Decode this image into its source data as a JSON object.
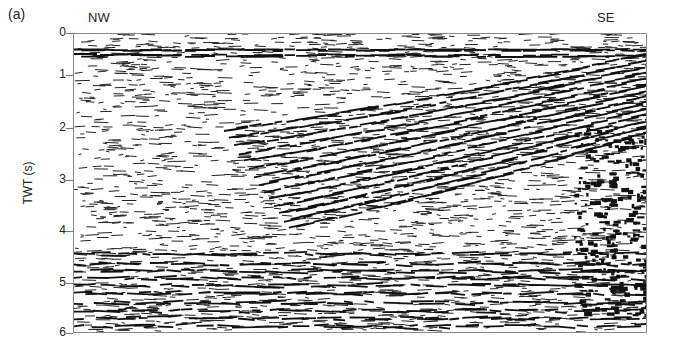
{
  "chart_data": {
    "type": "seismic-section",
    "panel_label": "(a)",
    "title": "",
    "xlabel": "",
    "ylabel": "TWT (s)",
    "direction_labels": {
      "left": "NW",
      "right": "SE"
    },
    "y_ticks": [
      0,
      1,
      2,
      3,
      4,
      5,
      6
    ],
    "ylim": [
      0,
      6
    ],
    "y_inverted": true,
    "grid": false,
    "legend": null,
    "features": [
      {
        "name": "strong flat reflector",
        "twt_s": 0.3,
        "extent": "full width"
      },
      {
        "name": "dipping reflector package",
        "description": "reflectors rising from ~3.3 s at centre-left to ~0.5 s at SE edge"
      },
      {
        "name": "chaotic high-amplitude zone",
        "location": "SE edge",
        "twt_range_s": [
          2,
          5.5
        ]
      }
    ]
  },
  "labels": {
    "panel": "(a)",
    "nw": "NW",
    "se": "SE",
    "ylabel": "TWT (s)",
    "ticks": [
      "0",
      "1",
      "2",
      "3",
      "4",
      "5",
      "6"
    ]
  }
}
